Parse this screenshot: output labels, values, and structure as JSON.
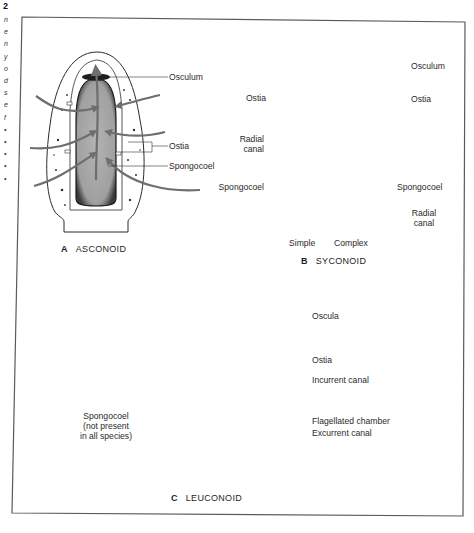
{
  "figure": {
    "margin_number": "2",
    "margin_letters": [
      "n",
      "e",
      "n",
      "y",
      "o",
      "d",
      "s",
      "e",
      "f",
      "•",
      "•",
      "•",
      "•",
      "•"
    ],
    "panels": [
      {
        "id": "A",
        "letter": "A",
        "title": "ASCONOID",
        "labels": {
          "osculum": "Osculum",
          "ostia": "Ostia",
          "spongocoel": "Spongocoel"
        }
      },
      {
        "id": "B",
        "letter": "B",
        "title": "SYCONOID",
        "labels": {
          "osculum": "Osculum",
          "ostia_left": "Ostia",
          "ostia_right": "Ostia",
          "radial_canal_left_line1": "Radial",
          "radial_canal_left_line2": "canal",
          "spongocoel_left": "Spongocoel",
          "spongocoel_right": "Spongocoel",
          "radial_canal_right_line1": "Radial",
          "radial_canal_right_line2": "canal",
          "simple": "Simple",
          "complex": "Complex"
        }
      },
      {
        "id": "C",
        "letter": "C",
        "title": "LEUCONOID",
        "labels": {
          "oscula": "Oscula",
          "ostia": "Ostia",
          "incurrent_canal": "Incurrent canal",
          "flagellated_chamber": "Flagellated chamber",
          "excurrent_canal": "Excurrent canal",
          "spongocoel_line1": "Spongocoel",
          "spongocoel_line2": "(not present",
          "spongocoel_line3": "in all species)"
        }
      }
    ],
    "colors": {
      "frame": "#5a5a5a",
      "arrow": "#6e6e6e",
      "cavity_fill": "#a9a9a9",
      "canal_fill": "#8c8c8c",
      "outline": "#2b2b2b"
    }
  }
}
